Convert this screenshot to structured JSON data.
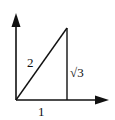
{
  "diagram": {
    "type": "right-triangle-on-axes",
    "labels": {
      "hypotenuse": "2",
      "vertical_side": "√3",
      "base": "1"
    },
    "colors": {
      "stroke": "#111111",
      "background": "#ffffff"
    }
  }
}
